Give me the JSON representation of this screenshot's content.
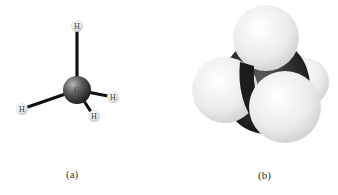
{
  "figure": {
    "panels": [
      {
        "id": "a",
        "caption": "(a)",
        "model": "ball-and-stick",
        "atoms": [
          {
            "label": "C",
            "role": "center"
          },
          {
            "label": "H",
            "role": "top"
          },
          {
            "label": "H",
            "role": "left"
          },
          {
            "label": "H",
            "role": "right"
          },
          {
            "label": "H",
            "role": "front"
          }
        ]
      },
      {
        "id": "b",
        "caption": "(b)",
        "model": "space-filling"
      }
    ],
    "colors": {
      "carbon": "#2a2a2a",
      "hydrogen": "#ececec",
      "bond": "#111111",
      "background": "#ffffff"
    }
  }
}
